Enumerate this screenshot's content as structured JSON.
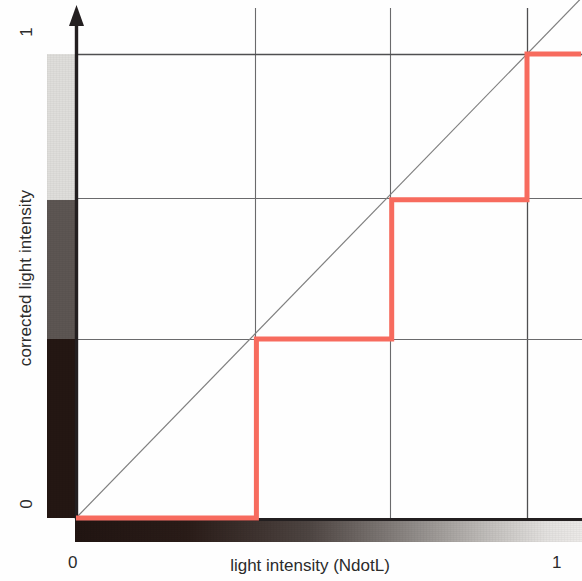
{
  "chart_data": {
    "type": "line",
    "title": "",
    "subtitle": "",
    "xlabel": "light intensity (NdotL)",
    "ylabel": "corrected light intensity",
    "xlim": [
      0,
      1
    ],
    "ylim": [
      0,
      1
    ],
    "x_ticks": [
      "0",
      "1"
    ],
    "x_tick_values": [
      0,
      1
    ],
    "y_ticks": [
      "0",
      "1"
    ],
    "y_tick_values": [
      0,
      1
    ],
    "grid": true,
    "grid_x_values": [
      0.4,
      0.7,
      1.0
    ],
    "grid_y_values": [
      0.386,
      0.686,
      1.0
    ],
    "legend": "none",
    "annotations": [],
    "series": [
      {
        "name": "corrected light intensity (quantized toon ramp)",
        "type": "step",
        "color": "#f76b5e",
        "linewidth": 4,
        "description": "Three-level staircase: flat at 0 until x=0.4, jumps to 0.386; flat until x=0.7, jumps to 0.686; flat until x=1.0, jumps to 1.0",
        "x": [
          0.0,
          0.4,
          0.4,
          0.7,
          0.7,
          1.0,
          1.0,
          1.12
        ],
        "y": [
          0.0,
          0.0,
          0.386,
          0.386,
          0.686,
          0.686,
          1.0,
          1.0
        ],
        "steps": [
          {
            "x_start": 0.0,
            "x_end": 0.4,
            "y": 0.0
          },
          {
            "x_start": 0.4,
            "x_end": 0.7,
            "y": 0.386
          },
          {
            "x_start": 0.7,
            "x_end": 1.0,
            "y": 0.686
          },
          {
            "x_start": 1.0,
            "x_end": 1.12,
            "y": 1.0
          }
        ]
      },
      {
        "name": "identity reference (y = x)",
        "type": "line",
        "color": "#808080",
        "linewidth": 1,
        "x": [
          0.0,
          1.12
        ],
        "y": [
          0.0,
          1.12
        ]
      }
    ],
    "y_ramp": {
      "description": "quantized grayscale ramp along y axis, three bands",
      "bands": [
        {
          "from": 0.686,
          "to": 1.0,
          "color": "#dfdedb"
        },
        {
          "from": 0.386,
          "to": 0.686,
          "color": "#5d5653"
        },
        {
          "from": 0.0,
          "to": 0.386,
          "color": "#241713"
        }
      ]
    },
    "x_ramp": {
      "description": "continuous grayscale ramp along x axis, dark to light",
      "from_color": "#211512",
      "to_color": "#eceae8"
    }
  },
  "axes": {
    "y_title": "corrected light intensity",
    "x_title": "light intensity (NdotL)",
    "y_tick_top": "1",
    "y_tick_bottom": "0",
    "x_tick_left": "0",
    "x_tick_right": "1"
  },
  "colors": {
    "step_curve": "#f76b5e",
    "identity_line": "#7a7a7a",
    "grid": "#59595b",
    "axis": "#231f20",
    "background": "#ffffff",
    "ramp_light": "#dfdedb",
    "ramp_mid": "#5d5653",
    "ramp_dark": "#241713"
  },
  "icons": {
    "y_axis_arrow": "arrow-up-icon"
  }
}
